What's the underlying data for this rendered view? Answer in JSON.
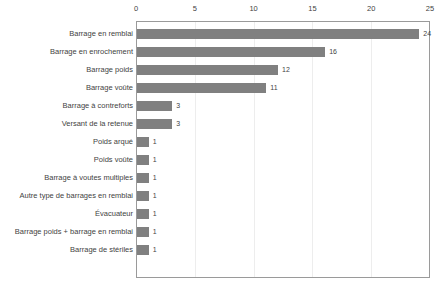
{
  "chart_data": {
    "type": "bar",
    "orientation": "horizontal",
    "title": "",
    "subtitle": "",
    "xlabel": "",
    "ylabel": "",
    "xlim": [
      0,
      25
    ],
    "ylim": null,
    "grid": true,
    "grid_axis": "x",
    "legend": false,
    "legend_position": "none",
    "axis_position": "top",
    "bar_color": "#808080",
    "gridline_color": "#ededed",
    "border_color": "#9a9a9a",
    "text_color": "#3f3f3f",
    "xticks": [
      0,
      5,
      10,
      15,
      20,
      25
    ],
    "xtick_labels": [
      "0",
      "5",
      "10",
      "15",
      "20",
      "25"
    ],
    "categories": [
      "Barrage en remblai",
      "Barrage en enrochement",
      "Barrage poids",
      "Barrage voûte",
      "Barrage à contreforts",
      "Versant de la retenue",
      "Poids arqué",
      "Poids voûte",
      "Barrage à voutes multiples",
      "Autre type de barrages en remblai",
      "Évacuateur",
      "Barrage poids + barrage en remblai",
      "Barrage de stériles"
    ],
    "values": [
      24,
      16,
      12,
      11,
      3,
      3,
      1,
      1,
      1,
      1,
      1,
      1,
      1
    ],
    "data_labels": [
      "24",
      "16",
      "12",
      "11",
      "3",
      "3",
      "1",
      "1",
      "1",
      "1",
      "1",
      "1",
      "1"
    ]
  }
}
